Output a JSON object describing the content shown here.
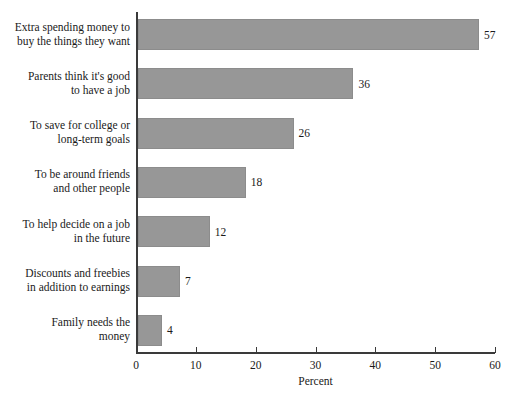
{
  "chart_data": {
    "type": "bar",
    "orientation": "horizontal",
    "title": "",
    "xlabel": "Percent",
    "ylabel": "",
    "xlim": [
      0,
      60
    ],
    "xticks": [
      0,
      10,
      20,
      30,
      40,
      50,
      60
    ],
    "xtick_labels": [
      "0",
      "10",
      "20",
      "30",
      "40",
      "50",
      "60"
    ],
    "grid": false,
    "legend": null,
    "bar_color": "#979797",
    "axis_color": "#3a3a3a",
    "text_color": "#1a1a1a",
    "background_color": "#ffffff",
    "categories": [
      "Extra spending money to\nbuy the things they want",
      "Parents think it's good\nto have a job",
      "To save for college or\nlong-term goals",
      "To be around friends\nand other people",
      "To help decide on a job\nin the future",
      "Discounts and freebies\nin addition to earnings",
      "Family needs the\nmoney"
    ],
    "values": [
      57,
      36,
      26,
      18,
      12,
      7,
      4
    ],
    "value_labels": [
      "57",
      "36",
      "26",
      "18",
      "12",
      "7",
      "4"
    ]
  }
}
